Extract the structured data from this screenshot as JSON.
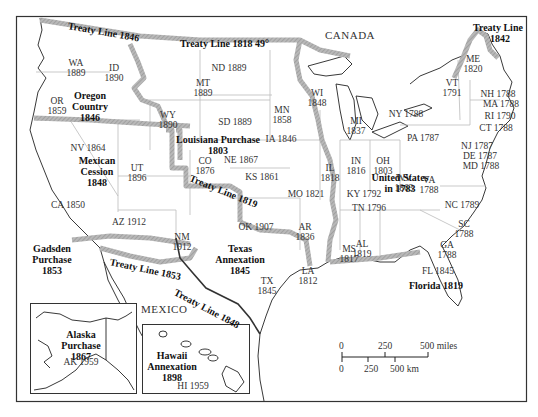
{
  "map": {
    "country_labels": {
      "canada": "CANADA",
      "mexico": "MEXICO"
    },
    "treaty_lines": [
      {
        "id": "t1846",
        "label": "Treaty Line 1846",
        "x": 68,
        "y": 20,
        "rot": 10
      },
      {
        "id": "t1818",
        "label": "Treaty Line 1818  49°",
        "x": 180,
        "y": 38,
        "rot": 0
      },
      {
        "id": "t1842",
        "label": "Treaty Line",
        "x": 473,
        "y": 22,
        "rot": 0
      },
      {
        "id": "t1842y",
        "label": "1842",
        "x": 490,
        "y": 33,
        "rot": 0
      },
      {
        "id": "t1819",
        "label": "Treaty Line 1819",
        "x": 190,
        "y": 172,
        "rot": 22
      },
      {
        "id": "t1853",
        "label": "Treaty Line 1853",
        "x": 110,
        "y": 256,
        "rot": 12
      },
      {
        "id": "t1848",
        "label": "Treaty Line 1848",
        "x": 175,
        "y": 286,
        "rot": 28
      }
    ],
    "acquisitions": [
      {
        "id": "oregon",
        "lines": [
          "Oregon",
          "Country",
          "1846"
        ],
        "x": 90,
        "y": 90
      },
      {
        "id": "louisiana",
        "lines": [
          "Louisiana Purchase",
          "1803"
        ],
        "x": 218,
        "y": 134
      },
      {
        "id": "mexican",
        "lines": [
          "Mexican",
          "Cession",
          "1848"
        ],
        "x": 97,
        "y": 155
      },
      {
        "id": "texas",
        "lines": [
          "Texas",
          "Annexation",
          "1845"
        ],
        "x": 240,
        "y": 243
      },
      {
        "id": "gadsden",
        "lines": [
          "Gadsden",
          "Purchase",
          "1853"
        ],
        "x": 52,
        "y": 243
      },
      {
        "id": "us1783",
        "lines": [
          "United States",
          "in 1783"
        ],
        "x": 400,
        "y": 172
      },
      {
        "id": "florida",
        "lines": [
          "Florida 1819"
        ],
        "x": 436,
        "y": 280
      },
      {
        "id": "alaska",
        "lines": [
          "Alaska",
          "Purchase",
          "1867"
        ],
        "x": 81,
        "y": 329
      },
      {
        "id": "hawaii",
        "lines": [
          "Hawaii",
          "Annexation",
          "1898"
        ],
        "x": 172,
        "y": 350
      }
    ],
    "states": [
      {
        "abbr": "WA",
        "year": "1889",
        "x": 76,
        "y": 58
      },
      {
        "abbr": "ID",
        "year": "1890",
        "x": 114,
        "y": 63
      },
      {
        "abbr": "OR",
        "year": "1859",
        "x": 57,
        "y": 96
      },
      {
        "abbr": "MT",
        "year": "1889",
        "x": 203,
        "y": 78
      },
      {
        "abbr": "WY",
        "year": "1890",
        "x": 168,
        "y": 110
      },
      {
        "abbr": "ND 1889",
        "year": "",
        "x": 229,
        "y": 63
      },
      {
        "abbr": "SD 1889",
        "year": "",
        "x": 235,
        "y": 117
      },
      {
        "abbr": "MN",
        "year": "1858",
        "x": 282,
        "y": 105
      },
      {
        "abbr": "WI",
        "year": "1848",
        "x": 317,
        "y": 88
      },
      {
        "abbr": "MI",
        "year": "1837",
        "x": 356,
        "y": 116
      },
      {
        "abbr": "NY 1788",
        "year": "",
        "x": 406,
        "y": 109
      },
      {
        "abbr": "VT",
        "year": "1791",
        "x": 452,
        "y": 78
      },
      {
        "abbr": "ME",
        "year": "1820",
        "x": 473,
        "y": 54
      },
      {
        "abbr": "NH 1788",
        "year": "",
        "x": 498,
        "y": 89
      },
      {
        "abbr": "MA 1788",
        "year": "",
        "x": 501,
        "y": 99
      },
      {
        "abbr": "RI 1790",
        "year": "",
        "x": 500,
        "y": 111
      },
      {
        "abbr": "CT 1788",
        "year": "",
        "x": 496,
        "y": 123
      },
      {
        "abbr": "PA 1787",
        "year": "",
        "x": 423,
        "y": 133
      },
      {
        "abbr": "NJ 1787",
        "year": "",
        "x": 477,
        "y": 141
      },
      {
        "abbr": "DE 1787",
        "year": "",
        "x": 480,
        "y": 151
      },
      {
        "abbr": "MD 1788",
        "year": "",
        "x": 481,
        "y": 161
      },
      {
        "abbr": "NV 1864",
        "year": "",
        "x": 88,
        "y": 143
      },
      {
        "abbr": "UT",
        "year": "1896",
        "x": 137,
        "y": 163
      },
      {
        "abbr": "CO",
        "year": "1876",
        "x": 205,
        "y": 156
      },
      {
        "abbr": "NE 1867",
        "year": "",
        "x": 241,
        "y": 155
      },
      {
        "abbr": "IA 1846",
        "year": "",
        "x": 281,
        "y": 134
      },
      {
        "abbr": "IL",
        "year": "1818",
        "x": 330,
        "y": 163
      },
      {
        "abbr": "IN",
        "year": "1816",
        "x": 356,
        "y": 156
      },
      {
        "abbr": "OH",
        "year": "1803",
        "x": 383,
        "y": 156
      },
      {
        "abbr": "WV",
        "year": "1863",
        "x": 404,
        "y": 173
      },
      {
        "abbr": "VA",
        "year": "1788",
        "x": 429,
        "y": 175
      },
      {
        "abbr": "KS 1861",
        "year": "",
        "x": 262,
        "y": 172
      },
      {
        "abbr": "MO 1821",
        "year": "",
        "x": 306,
        "y": 189
      },
      {
        "abbr": "KY 1792",
        "year": "",
        "x": 364,
        "y": 189
      },
      {
        "abbr": "TN 1796",
        "year": "",
        "x": 369,
        "y": 203
      },
      {
        "abbr": "NC 1789",
        "year": "",
        "x": 462,
        "y": 200
      },
      {
        "abbr": "SC",
        "year": "1788",
        "x": 464,
        "y": 219
      },
      {
        "abbr": "GA",
        "year": "1788",
        "x": 447,
        "y": 240
      },
      {
        "abbr": "CA 1850",
        "year": "",
        "x": 68,
        "y": 200
      },
      {
        "abbr": "AZ 1912",
        "year": "",
        "x": 129,
        "y": 217
      },
      {
        "abbr": "NM",
        "year": "1912",
        "x": 182,
        "y": 232
      },
      {
        "abbr": "OK 1907",
        "year": "",
        "x": 256,
        "y": 222
      },
      {
        "abbr": "AR",
        "year": "1836",
        "x": 305,
        "y": 222
      },
      {
        "abbr": "MS",
        "year": "1817",
        "x": 349,
        "y": 244
      },
      {
        "abbr": "AL",
        "year": "1819",
        "x": 362,
        "y": 239
      },
      {
        "abbr": "TX",
        "year": "1845",
        "x": 267,
        "y": 276
      },
      {
        "abbr": "LA",
        "year": "1812",
        "x": 308,
        "y": 266
      },
      {
        "abbr": "FL 1845",
        "year": "",
        "x": 438,
        "y": 266
      },
      {
        "abbr": "AK 1959",
        "year": "",
        "x": 81,
        "y": 357
      },
      {
        "abbr": "HI 1959",
        "year": "",
        "x": 193,
        "y": 381
      }
    ],
    "scale_bar": {
      "miles": [
        "0",
        "250",
        "500 miles"
      ],
      "km": [
        "0",
        "250",
        "500 km"
      ]
    }
  }
}
